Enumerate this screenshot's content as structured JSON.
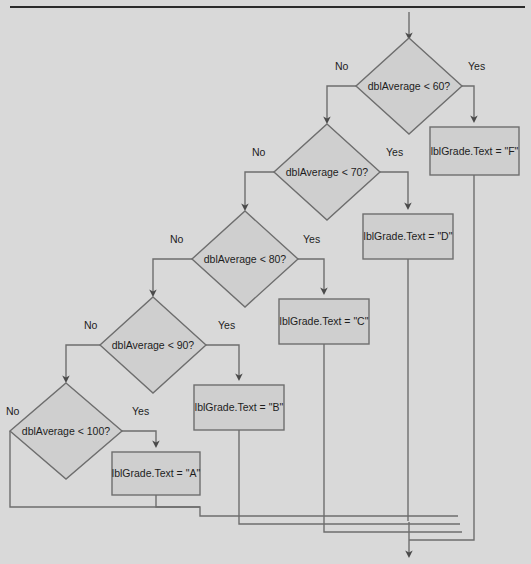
{
  "diagram": {
    "background_color": "#d9d9d9",
    "node_fill": "#cfcfcf",
    "node_stroke": "#6e6e6e",
    "top_rule": {
      "x1": 10,
      "x2": 525,
      "y": 7
    },
    "entry_arrow": {
      "x": 409,
      "y_from": 12,
      "y_to": 38
    },
    "exit_arrow": {
      "x": 409,
      "y_from": 522,
      "y_to": 556
    },
    "decisions": [
      {
        "id": "d60",
        "label": "dblAverage < 60?",
        "cx": 409,
        "cy": 86,
        "rx": 53,
        "ry": 48
      },
      {
        "id": "d70",
        "label": "dblAverage < 70?",
        "cx": 327,
        "cy": 172,
        "rx": 53,
        "ry": 48
      },
      {
        "id": "d80",
        "label": "dblAverage < 80?",
        "cx": 245,
        "cy": 259,
        "rx": 53,
        "ry": 48
      },
      {
        "id": "d90",
        "label": "dblAverage < 90?",
        "cx": 153,
        "cy": 345,
        "rx": 53,
        "ry": 48
      },
      {
        "id": "d100",
        "label": "dblAverage < 100?",
        "cx": 66,
        "cy": 431,
        "rx": 56,
        "ry": 48
      }
    ],
    "processes": [
      {
        "id": "gF",
        "label": "lblGrade.Text = \"F\"",
        "x": 430,
        "y": 127,
        "w": 89,
        "h": 48
      },
      {
        "id": "gD",
        "label": "lblGrade.Text = \"D\"",
        "x": 363,
        "y": 214,
        "w": 90,
        "h": 45
      },
      {
        "id": "gC",
        "label": "lblGrade.Text = \"C\"",
        "x": 279,
        "y": 299,
        "w": 90,
        "h": 45
      },
      {
        "id": "gB",
        "label": "lblGrade.Text = \"B\"",
        "x": 194,
        "y": 385,
        "w": 90,
        "h": 45
      },
      {
        "id": "gA",
        "label": "lblGrade.Text = \"A\"",
        "x": 112,
        "y": 452,
        "w": 88,
        "h": 43
      }
    ],
    "branch_labels": [
      {
        "id": "yes60",
        "text": "Yes",
        "x": 468,
        "y": 66
      },
      {
        "id": "no60",
        "text": "No",
        "x": 335,
        "y": 66
      },
      {
        "id": "yes70",
        "text": "Yes",
        "x": 386,
        "y": 152
      },
      {
        "id": "no70",
        "text": "No",
        "x": 252,
        "y": 152
      },
      {
        "id": "yes80",
        "text": "Yes",
        "x": 303,
        "y": 239
      },
      {
        "id": "no80",
        "text": "No",
        "x": 170,
        "y": 239
      },
      {
        "id": "yes90",
        "text": "Yes",
        "x": 218,
        "y": 325
      },
      {
        "id": "no90",
        "text": "No",
        "x": 84,
        "y": 325
      },
      {
        "id": "yes100",
        "text": "Yes",
        "x": 132,
        "y": 411
      },
      {
        "id": "no100",
        "text": "No",
        "x": 8,
        "y": 411
      }
    ],
    "connectors": {
      "yes_branches": [
        {
          "from": "d60",
          "to": "gF",
          "path": "M 462 86 L 474 86 L 474 121"
        },
        {
          "from": "d70",
          "to": "gD",
          "path": "M 380 172 L 408 172 L 408 208"
        },
        {
          "from": "d80",
          "to": "gC",
          "path": "M 298 259 L 324 259 L 324 293"
        },
        {
          "from": "d90",
          "to": "gB",
          "path": "M 206 345 L 239 345 L 239 379"
        },
        {
          "from": "d100",
          "to": "gA",
          "path": "M 122 431 L 156 431 L 156 446"
        }
      ],
      "no_branches": [
        {
          "from": "d60",
          "to": "d70",
          "path": "M 356 86 L 327 86 L 327 124"
        },
        {
          "from": "d70",
          "to": "d80",
          "path": "M 274 172 L 245 172 L 245 211"
        },
        {
          "from": "d80",
          "to": "d90",
          "path": "M 192 259 L 153 259 L 153 297"
        },
        {
          "from": "d90",
          "to": "d100",
          "path": "M 100 345 L 66 345 L 66 383"
        },
        {
          "from": "d100",
          "to": "merge",
          "path": "M 10 431 L 10 507 L 200 507"
        }
      ],
      "merge_paths": [
        {
          "id": "m-a",
          "path": "M 156 495 L 156 507 L 200 507 L 200 516 L 458 516"
        },
        {
          "id": "m-b",
          "path": "M 239 430 L 239 524 L 460 524"
        },
        {
          "id": "m-c",
          "path": "M 324 344 L 324 532 L 462 532"
        },
        {
          "id": "m-d",
          "path": "M 408 259 L 408 522"
        },
        {
          "id": "m-f",
          "path": "M 474 175 L 474 540 L 409 540"
        }
      ]
    }
  }
}
